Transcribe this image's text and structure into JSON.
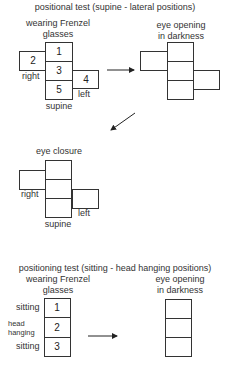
{
  "top": {
    "title": "positional test (supine - lateral positions)",
    "left_caption_line1": "wearing Frenzel",
    "left_caption_line2": "glasses",
    "right_caption_line1": "eye opening",
    "right_caption_line2": "in darkness",
    "labels": {
      "right": "right",
      "left": "left",
      "supine": "supine"
    },
    "numbers": {
      "top": "1",
      "side_right": "2",
      "middle": "3",
      "side_left": "4",
      "bottom": "5"
    }
  },
  "middle": {
    "caption": "eye closure",
    "labels": {
      "right": "right",
      "left": "left",
      "supine": "supine"
    }
  },
  "bottom": {
    "title": "positioning test (sitting - head hanging positions)",
    "left_caption_line1": "wearing Frenzel",
    "left_caption_line2": "glasses",
    "right_caption_line1": "eye opening",
    "right_caption_line2": "in darkness",
    "rows": [
      {
        "label": "sitting",
        "number": "1"
      },
      {
        "label_line1": "head",
        "label_line2": "hanging",
        "number": "2"
      },
      {
        "label": "sitting",
        "number": "3"
      }
    ]
  },
  "colors": {
    "line": "#333333",
    "background": "#ffffff"
  }
}
